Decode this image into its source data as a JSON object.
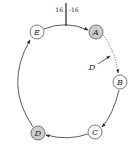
{
  "diagram": {
    "type": "ring",
    "tick": {
      "left_label": "16",
      "right_label": "-16"
    },
    "nodes": [
      {
        "id": "E",
        "label": "E",
        "cx": 37,
        "cy": 32,
        "filled": false
      },
      {
        "id": "A",
        "label": "A",
        "cx": 96,
        "cy": 32,
        "filled": true
      },
      {
        "id": "B",
        "label": "B",
        "cx": 120,
        "cy": 82,
        "filled": false
      },
      {
        "id": "C",
        "label": "C",
        "cx": 95,
        "cy": 132,
        "filled": false
      },
      {
        "id": "D",
        "label": "D",
        "cx": 38,
        "cy": 133,
        "filled": true
      }
    ],
    "pointer": {
      "label": "D"
    },
    "edges": [
      {
        "from": "E",
        "to": "A",
        "style": "solid"
      },
      {
        "from": "A",
        "to": "B",
        "style": "dotted"
      },
      {
        "from": "B",
        "to": "C",
        "style": "solid"
      },
      {
        "from": "C",
        "to": "D",
        "style": "solid"
      },
      {
        "from": "D",
        "to": "E",
        "style": "solid"
      }
    ],
    "colors": {
      "stroke": "#333333",
      "filled_node": "#cccccc",
      "node_fill": "#ffffff"
    }
  }
}
